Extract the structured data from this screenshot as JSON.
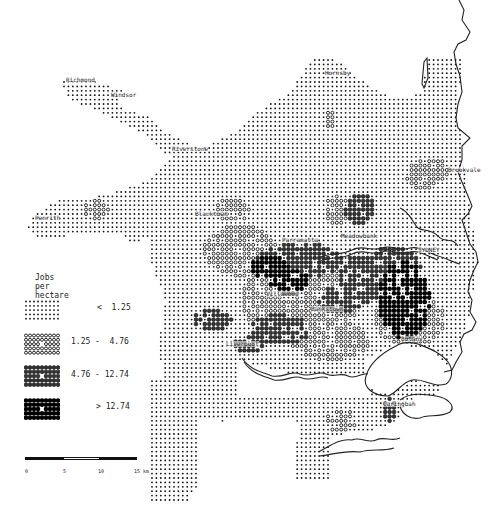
{
  "map": {
    "title": "Jobs per hectare",
    "region": "Sydney",
    "colors": {
      "ink": "#111111",
      "paper": "#ffffff",
      "coast": "#222222"
    },
    "places": [
      {
        "name": "Richmond",
        "x": 66,
        "y": 77
      },
      {
        "name": "Windsor",
        "x": 111,
        "y": 92
      },
      {
        "name": "Riverstone",
        "x": 172,
        "y": 146
      },
      {
        "name": "Hornsby",
        "x": 325,
        "y": 70
      },
      {
        "name": "Brookvale",
        "x": 448,
        "y": 167
      },
      {
        "name": "Penrith",
        "x": 35,
        "y": 215
      },
      {
        "name": "Blacktown",
        "x": 195,
        "y": 211
      },
      {
        "name": "Parramatta",
        "x": 282,
        "y": 237
      },
      {
        "name": "Meadowbank",
        "x": 341,
        "y": 233
      },
      {
        "name": "SYDNEY",
        "x": 418,
        "y": 247
      },
      {
        "name": "Villawood",
        "x": 266,
        "y": 291
      },
      {
        "name": "Bankstown",
        "x": 311,
        "y": 306
      },
      {
        "name": "Liverpool",
        "x": 226,
        "y": 341
      },
      {
        "name": "Botany",
        "x": 401,
        "y": 336
      },
      {
        "name": "Caringbah",
        "x": 383,
        "y": 401
      }
    ],
    "legend": {
      "title": "Jobs per hectare",
      "classes": [
        {
          "label": "<  1.25",
          "symbol": "dot",
          "level": 1
        },
        {
          "label": "1.25 -  4.76",
          "symbol": "ring",
          "level": 2
        },
        {
          "label": "4.76 - 12.74",
          "symbol": "filled-ring",
          "level": 3
        },
        {
          "label": "> 12.74",
          "symbol": "solid",
          "level": 4
        }
      ]
    },
    "scale_bar": {
      "ticks": [
        "0",
        "5",
        "10",
        "15 km"
      ],
      "max_km": 15
    }
  }
}
